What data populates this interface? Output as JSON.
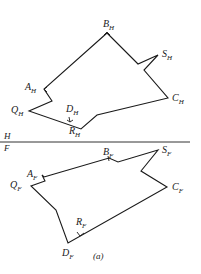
{
  "figure": {
    "caption": "(a)",
    "fold_line": {
      "upper_plane": "H",
      "lower_plane": "F"
    }
  },
  "top_view": {
    "plane": "H",
    "points": {
      "A": {
        "letter": "A",
        "sub": "H"
      },
      "B": {
        "letter": "B",
        "sub": "H"
      },
      "S": {
        "letter": "S",
        "sub": "H"
      },
      "C": {
        "letter": "C",
        "sub": "H"
      },
      "D": {
        "letter": "D",
        "sub": "H"
      },
      "R": {
        "letter": "R",
        "sub": "H"
      },
      "Q": {
        "letter": "Q",
        "sub": "H"
      }
    }
  },
  "front_view": {
    "plane": "F",
    "points": {
      "A": {
        "letter": "A",
        "sub": "F"
      },
      "B": {
        "letter": "B",
        "sub": "F"
      },
      "S": {
        "letter": "S",
        "sub": "F"
      },
      "C": {
        "letter": "C",
        "sub": "F"
      },
      "R": {
        "letter": "R",
        "sub": "F"
      },
      "D": {
        "letter": "D",
        "sub": "F"
      },
      "Q": {
        "letter": "Q",
        "sub": "F"
      }
    }
  }
}
